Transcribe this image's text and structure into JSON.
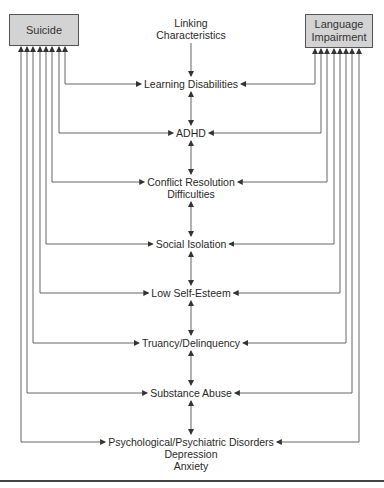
{
  "diagram": {
    "title_node": {
      "lines": [
        "Linking",
        "Characteristics"
      ]
    },
    "left_box": {
      "label": "Suicide"
    },
    "right_box": {
      "lines": [
        "Language",
        "Impairment"
      ]
    },
    "characteristics": [
      {
        "lines": [
          "Learning Disabilities"
        ]
      },
      {
        "lines": [
          "ADHD"
        ]
      },
      {
        "lines": [
          "Conflict Resolution",
          "Difficulties"
        ]
      },
      {
        "lines": [
          "Social Isolation"
        ]
      },
      {
        "lines": [
          "Low Self-Esteem"
        ]
      },
      {
        "lines": [
          "Truancy/Delinquency"
        ]
      },
      {
        "lines": [
          "Substance Abuse"
        ]
      },
      {
        "lines": [
          "Psychological/Psychiatric Disorders",
          "Depression",
          "Anxiety"
        ]
      }
    ],
    "colors": {
      "box_fill": "#d3d3d3",
      "line": "#555555",
      "text": "#2a2a2a"
    }
  }
}
